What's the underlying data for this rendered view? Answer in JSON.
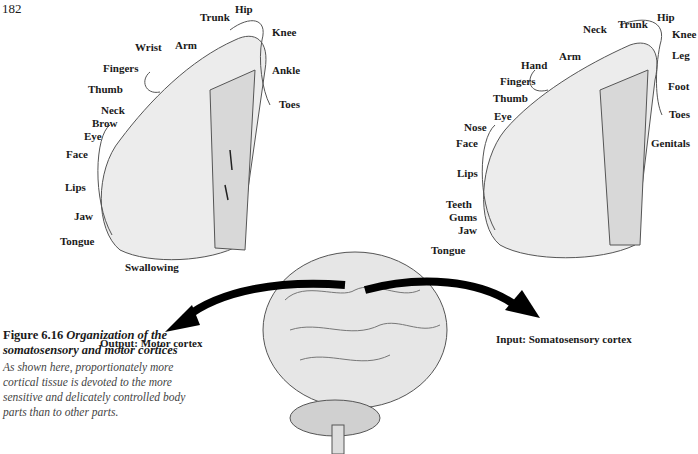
{
  "page_number": "182",
  "motor_cortex": {
    "labels": [
      {
        "text": "Hip",
        "x": 235,
        "y": 3
      },
      {
        "text": "Trunk",
        "x": 200,
        "y": 11
      },
      {
        "text": "Knee",
        "x": 272,
        "y": 26
      },
      {
        "text": "Wrist",
        "x": 135,
        "y": 41
      },
      {
        "text": "Arm",
        "x": 175,
        "y": 39
      },
      {
        "text": "Fingers",
        "x": 103,
        "y": 62
      },
      {
        "text": "Ankle",
        "x": 272,
        "y": 64
      },
      {
        "text": "Thumb",
        "x": 88,
        "y": 83
      },
      {
        "text": "Toes",
        "x": 279,
        "y": 98
      },
      {
        "text": "Neck",
        "x": 101,
        "y": 104
      },
      {
        "text": "Brow",
        "x": 92,
        "y": 117
      },
      {
        "text": "Eye",
        "x": 84,
        "y": 130
      },
      {
        "text": "Face",
        "x": 66,
        "y": 148
      },
      {
        "text": "Lips",
        "x": 65,
        "y": 181
      },
      {
        "text": "Jaw",
        "x": 74,
        "y": 210
      },
      {
        "text": "Tongue",
        "x": 60,
        "y": 235
      },
      {
        "text": "Swallowing",
        "x": 125,
        "y": 261
      }
    ],
    "output_label": "Output: Motor cortex"
  },
  "somatosensory_cortex": {
    "labels": [
      {
        "text": "Hip",
        "x": 657,
        "y": 11
      },
      {
        "text": "Neck",
        "x": 583,
        "y": 23
      },
      {
        "text": "Trunk",
        "x": 618,
        "y": 18
      },
      {
        "text": "Knee",
        "x": 672,
        "y": 28
      },
      {
        "text": "Arm",
        "x": 559,
        "y": 50
      },
      {
        "text": "Leg",
        "x": 672,
        "y": 49
      },
      {
        "text": "Hand",
        "x": 521,
        "y": 59
      },
      {
        "text": "Fingers",
        "x": 500,
        "y": 75
      },
      {
        "text": "Foot",
        "x": 668,
        "y": 80
      },
      {
        "text": "Thumb",
        "x": 493,
        "y": 92
      },
      {
        "text": "Eye",
        "x": 494,
        "y": 110
      },
      {
        "text": "Toes",
        "x": 669,
        "y": 108
      },
      {
        "text": "Nose",
        "x": 464,
        "y": 121
      },
      {
        "text": "Face",
        "x": 456,
        "y": 137
      },
      {
        "text": "Genitals",
        "x": 651,
        "y": 137
      },
      {
        "text": "Lips",
        "x": 457,
        "y": 167
      },
      {
        "text": "Teeth",
        "x": 446,
        "y": 198
      },
      {
        "text": "Gums",
        "x": 449,
        "y": 211
      },
      {
        "text": "Jaw",
        "x": 458,
        "y": 224
      },
      {
        "text": "Tongue",
        "x": 431,
        "y": 244
      }
    ],
    "input_label": "Input: Somatosensory cortex"
  },
  "caption": {
    "figure_number": "Figure 6.16",
    "title_line1": "Organization of the",
    "title_line2": "somatosensory and motor cortices",
    "body": "As shown here, proportionately more cortical tissue is devoted to the more sensitive and delicately controlled body parts than to other parts."
  }
}
